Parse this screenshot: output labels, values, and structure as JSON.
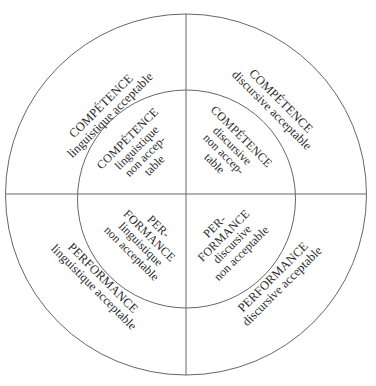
{
  "diagram": {
    "title": "",
    "colors": {
      "line": "#555555",
      "text": "#2a2a2a",
      "background": "#ffffff"
    },
    "geometry": {
      "center": [
        186,
        194
      ],
      "outer_radius": 180,
      "inner_radius": 108
    },
    "quadrants": {
      "top_left": {
        "outer": {
          "main": "COMPÉTENCE",
          "sub": [
            "linguistique acceptable"
          ]
        },
        "inner": {
          "main": "COMPÉTENCE",
          "sub": [
            "linguistique",
            "non accep-",
            "table"
          ]
        }
      },
      "top_right": {
        "outer": {
          "main": "COMPÉTENCE",
          "sub": [
            "discursive acceptable"
          ]
        },
        "inner": {
          "main": "COMPÉTENCE",
          "sub": [
            "discursive",
            "non accep-",
            "table"
          ]
        }
      },
      "bottom_left": {
        "outer": {
          "main": "PERFORMANCE",
          "sub": [
            "linguistique acceptable"
          ]
        },
        "inner": {
          "main": [
            "PER-",
            "FORMANCE"
          ],
          "sub": [
            "linguistique",
            "non acceptable"
          ]
        }
      },
      "bottom_right": {
        "outer": {
          "main": "PERFORMANCE",
          "sub": [
            "discursive acceptable"
          ]
        },
        "inner": {
          "main": [
            "PER-",
            "FORMANCE"
          ],
          "sub": [
            "discursive",
            "non acceptable"
          ]
        }
      }
    }
  }
}
